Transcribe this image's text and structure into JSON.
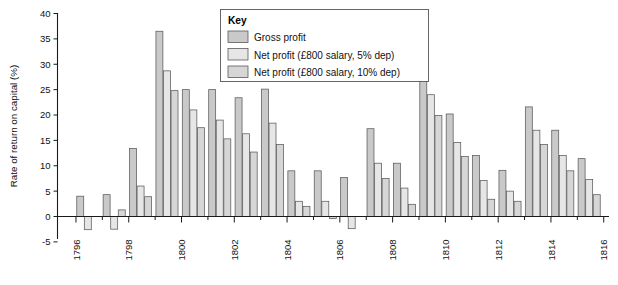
{
  "chart_data": {
    "type": "bar",
    "title": "",
    "xlabel": "",
    "ylabel": "Rate of return on capital (%)",
    "ylim": [
      -5,
      40
    ],
    "ytick_values": [
      -5,
      0,
      5,
      10,
      15,
      20,
      25,
      30,
      35,
      40
    ],
    "ytick_labels": [
      "-5",
      "0",
      "5",
      "10",
      "15",
      "20",
      "25",
      "30",
      "35",
      "40"
    ],
    "xlim": [
      1795.3,
      1816.2
    ],
    "xtick_values": [
      1796,
      1798,
      1800,
      1802,
      1804,
      1806,
      1808,
      1810,
      1812,
      1814,
      1816
    ],
    "xtick_labels": [
      "1796",
      "1798",
      "1800",
      "1802",
      "1804",
      "1806",
      "1808",
      "1810",
      "1812",
      "1814",
      "1816"
    ],
    "grid": false,
    "legend_position": "top-center",
    "categories": [
      1796,
      1797,
      1798,
      1799,
      1800,
      1801,
      1802,
      1803,
      1804,
      1805,
      1806,
      1807,
      1808,
      1809,
      1810,
      1811,
      1812,
      1813,
      1814,
      1815
    ],
    "series": [
      {
        "name": "Gross profit",
        "color": "#c9c9c9",
        "values": [
          4.0,
          4.3,
          13.4,
          36.5,
          25.0,
          25.0,
          23.4,
          25.1,
          9.0,
          9.0,
          7.7,
          17.3,
          10.5,
          30.0,
          20.2,
          12.0,
          9.1,
          21.6,
          17.0,
          11.4
        ]
      },
      {
        "name": "Net profit (£800 salary, 5% dep)",
        "color": "#e6e6e6",
        "values": [
          -2.6,
          -2.5,
          6.0,
          28.7,
          21.0,
          19.0,
          16.3,
          18.4,
          3.0,
          3.0,
          -2.4,
          10.5,
          5.6,
          24.0,
          14.6,
          7.1,
          5.0,
          17.0,
          12.0,
          7.3
        ]
      },
      {
        "name": "Net profit (£800 salary, 10% dep)",
        "color": "#d6d6d6",
        "values": [
          null,
          1.3,
          3.9,
          24.8,
          17.5,
          15.3,
          12.7,
          14.2,
          2.0,
          -0.4,
          null,
          7.5,
          2.4,
          19.9,
          11.8,
          3.4,
          3.0,
          14.2,
          9.0,
          4.3
        ]
      }
    ],
    "legend_entries": [
      "Gross profit",
      "Net profit (£800 salary, 5% dep)",
      "Net profit (£800 salary, 10% dep)"
    ],
    "legend_heading": "Key"
  },
  "colors": {
    "series1": "#c9c9c9",
    "series2": "#e6e6e6",
    "series3": "#d6d6d6",
    "axis": "#1a1a1a",
    "bar_border": "#5a5a5a",
    "background": "#ffffff"
  }
}
